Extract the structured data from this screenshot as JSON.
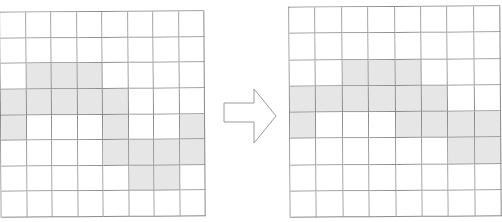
{
  "diagram": {
    "left_grid": {
      "rows": 8,
      "cols": 8,
      "shaded": [
        [
          0,
          0,
          0,
          0,
          0,
          0,
          0,
          0
        ],
        [
          0,
          0,
          0,
          0,
          0,
          0,
          0,
          0
        ],
        [
          0,
          1,
          1,
          1,
          0,
          0,
          0,
          0
        ],
        [
          1,
          1,
          1,
          1,
          1,
          0,
          0,
          0
        ],
        [
          1,
          0,
          0,
          0,
          1,
          0,
          0,
          1
        ],
        [
          0,
          0,
          0,
          0,
          1,
          1,
          1,
          1
        ],
        [
          0,
          0,
          0,
          0,
          0,
          1,
          1,
          0
        ],
        [
          0,
          0,
          0,
          0,
          0,
          0,
          0,
          0
        ]
      ]
    },
    "arrow": {
      "direction": "right",
      "icon": "arrow-right-outline-icon"
    },
    "right_grid": {
      "rows": 8,
      "cols": 8,
      "shaded": [
        [
          0,
          0,
          0,
          0,
          0,
          0,
          0,
          0
        ],
        [
          0,
          0,
          0,
          0,
          0,
          0,
          0,
          0
        ],
        [
          0,
          0,
          1,
          1,
          1,
          0,
          0,
          0
        ],
        [
          1,
          1,
          1,
          1,
          1,
          1,
          0,
          0
        ],
        [
          1,
          0,
          0,
          0,
          1,
          1,
          1,
          1
        ],
        [
          0,
          0,
          0,
          0,
          0,
          0,
          1,
          1
        ],
        [
          0,
          0,
          0,
          0,
          0,
          0,
          0,
          0
        ],
        [
          0,
          0,
          0,
          0,
          0,
          0,
          0,
          0
        ]
      ]
    },
    "colors": {
      "shaded": "#e6e6e6",
      "line": "#8a8a8a",
      "background": "#ffffff"
    }
  }
}
